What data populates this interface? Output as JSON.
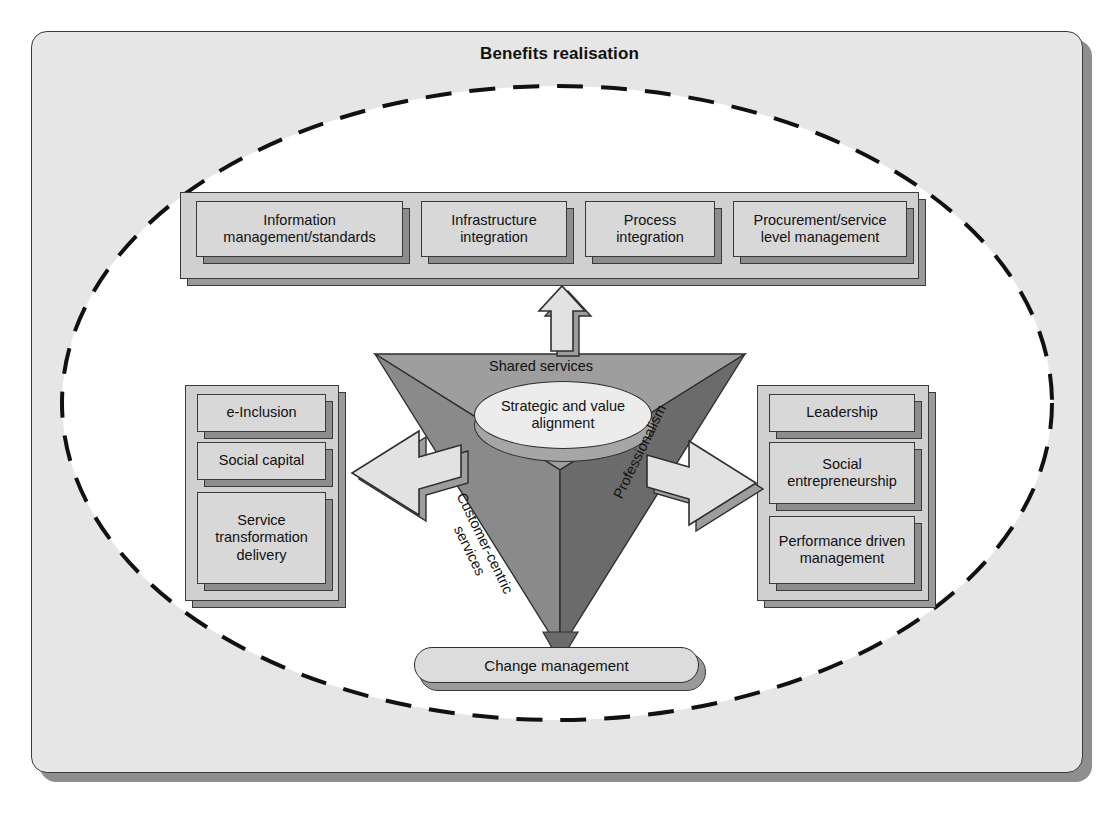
{
  "title": "Benefits realisation",
  "colors": {
    "page_bg": "#ffffff",
    "frame_bg": "#e6e6e6",
    "frame_border": "#3a3a3a",
    "ellipse_fill": "#ffffff",
    "ellipse_dash": "#111111",
    "box_face": "#d8d8d8",
    "box_side": "#8d8d8d",
    "group_face": "#d0d0d0",
    "group_side": "#9a9a9a",
    "tri_top": "#9e9e9e",
    "tri_left": "#8a8a8a",
    "tri_right": "#6b6b6b",
    "oval_fill": "#ececec",
    "arrow_fill": "#e2e2e2",
    "arrow_side": "#9a9a9a"
  },
  "top_group": {
    "name": "capability-enablers",
    "items": [
      {
        "label_line1": "Information",
        "label_line2": "management/standards"
      },
      {
        "label_line1": "Infrastructure",
        "label_line2": "integration"
      },
      {
        "label_line1": "Process",
        "label_line2": "integration"
      },
      {
        "label_line1": "Procurement/service",
        "label_line2": "level management"
      }
    ]
  },
  "left_group": {
    "name": "citizen-outcomes",
    "items": [
      {
        "label_line1": "e-Inclusion",
        "label_line2": "",
        "label_line3": ""
      },
      {
        "label_line1": "Social capital",
        "label_line2": "",
        "label_line3": ""
      },
      {
        "label_line1": "Service",
        "label_line2": "transformation",
        "label_line3": "delivery"
      }
    ]
  },
  "right_group": {
    "name": "organisational-outcomes",
    "items": [
      {
        "label_line1": "Leadership",
        "label_line2": "",
        "label_line3": ""
      },
      {
        "label_line1": "Social",
        "label_line2": "entrepreneurship",
        "label_line3": ""
      },
      {
        "label_line1": "Performance driven",
        "label_line2": "management",
        "label_line3": ""
      }
    ]
  },
  "triangle": {
    "segments": [
      {
        "id": "shared-services",
        "label": "Shared services",
        "shade": "#9e9e9e"
      },
      {
        "id": "customer-centric-services",
        "label": "Customer-centric",
        "label2": "services",
        "shade": "#8a8a8a"
      },
      {
        "id": "professionalism",
        "label": "Professionalism",
        "shade": "#6b6b6b"
      }
    ],
    "centre": {
      "label_line1": "Strategic and value",
      "label_line2": "alignment"
    }
  },
  "bottom_pill": {
    "label": "Change management"
  },
  "arrows": [
    {
      "id": "arrow-up",
      "direction": "up",
      "from": "triangle",
      "to": "top-group"
    },
    {
      "id": "arrow-left",
      "direction": "left",
      "from": "triangle",
      "to": "left-group"
    },
    {
      "id": "arrow-right",
      "direction": "right",
      "from": "triangle",
      "to": "right-group"
    }
  ]
}
